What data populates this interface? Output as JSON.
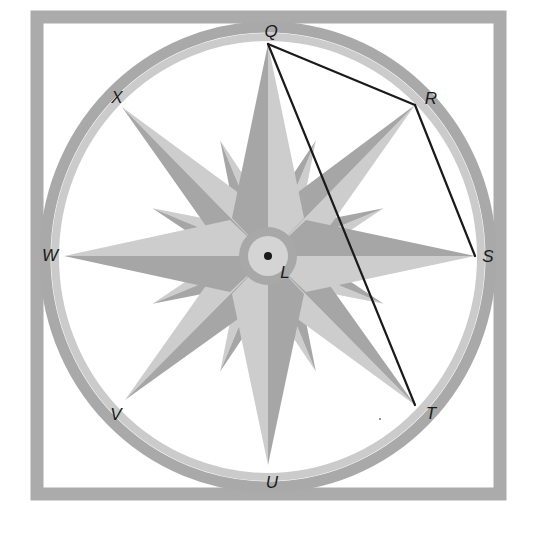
{
  "diagram": {
    "type": "geometry-compass-rose",
    "center": {
      "name": "L",
      "x": 268,
      "y": 256
    },
    "colors": {
      "frame": "#ababab",
      "ring_outer": "#a9a9a9",
      "ring_inner": "#cbcbcb",
      "star_dark": "#a6a6a6",
      "star_light": "#cdcdcd",
      "hub_ring": "#a8a8a8",
      "hub_center": "#d4d4d4",
      "line": "#1a1a1a",
      "point": "#1a1a1a"
    },
    "points": [
      {
        "name": "Q",
        "x": 268,
        "y": 44,
        "label_x": 271,
        "label_y": 31
      },
      {
        "name": "R",
        "x": 415,
        "y": 105,
        "label_x": 431,
        "label_y": 98
      },
      {
        "name": "S",
        "x": 475,
        "y": 256,
        "label_x": 488,
        "label_y": 256
      },
      {
        "name": "T",
        "x": 415,
        "y": 405,
        "label_x": 431,
        "label_y": 413
      },
      {
        "name": "U",
        "x": 268,
        "y": 465,
        "label_x": 272,
        "label_y": 482
      },
      {
        "name": "V",
        "x": 125,
        "y": 400,
        "label_x": 116,
        "label_y": 414
      },
      {
        "name": "W",
        "x": 64,
        "y": 256,
        "label_x": 50,
        "label_y": 255
      },
      {
        "name": "X",
        "x": 122,
        "y": 107,
        "label_x": 117,
        "label_y": 97
      },
      {
        "name": "L",
        "x": 268,
        "y": 256,
        "label_x": 285,
        "label_y": 272
      }
    ],
    "segments": [
      {
        "from": "Q",
        "to": "R"
      },
      {
        "from": "R",
        "to": "S"
      },
      {
        "from": "Q",
        "to": "T"
      }
    ],
    "labels": {
      "Q": "Q",
      "R": "R",
      "S": "S",
      "T": "T",
      "U": "U",
      "V": "V",
      "W": "W",
      "X": "X",
      "L": "L"
    }
  }
}
